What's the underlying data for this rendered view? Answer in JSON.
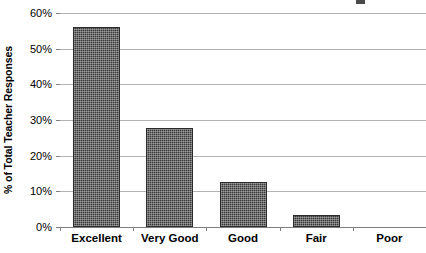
{
  "chart_data": {
    "type": "bar",
    "title": "",
    "xlabel": "",
    "ylabel": "% of Total Teacher Responses",
    "categories": [
      "Excellent",
      "Very Good",
      "Good",
      "Fair",
      "Poor"
    ],
    "values": [
      56.2,
      27.7,
      12.5,
      3.4,
      0
    ],
    "series": [
      {
        "name": "% of Total Teacher Responses",
        "values": [
          56.2,
          27.7,
          12.5,
          3.4,
          0
        ]
      }
    ],
    "ylim": [
      0,
      60
    ],
    "ytick_values": [
      0,
      10,
      20,
      30,
      40,
      50,
      60
    ],
    "ytick_labels": [
      "0%",
      "10%",
      "20%",
      "30%",
      "40%",
      "50%",
      "60%"
    ],
    "grid": true,
    "grid_axis": "y",
    "legend": false,
    "legend_position": "none",
    "bar_color": "#3b3b3b",
    "gridline_color": "#b3b3b3",
    "axis_color": "#808080",
    "background_color": "#ffffff"
  }
}
